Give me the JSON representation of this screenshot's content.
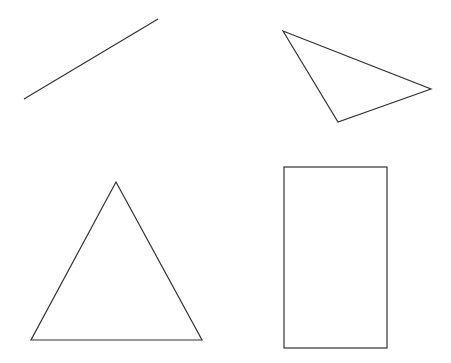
{
  "canvas": {
    "width": 451,
    "height": 363,
    "background": "#ffffff",
    "stroke_color": "#333333"
  },
  "shapes": [
    {
      "kind": "line",
      "name": "line-segment",
      "points": [
        [
          24,
          99
        ],
        [
          158,
          19
        ]
      ]
    },
    {
      "kind": "triangle",
      "name": "scalene-triangle",
      "points": [
        [
          283,
          31
        ],
        [
          431,
          89
        ],
        [
          338,
          122
        ]
      ]
    },
    {
      "kind": "triangle",
      "name": "isosceles-triangle",
      "points": [
        [
          116,
          182
        ],
        [
          31,
          340
        ],
        [
          202,
          340
        ]
      ]
    },
    {
      "kind": "rectangle",
      "name": "rectangle",
      "x": 284,
      "y": 167,
      "width": 103,
      "height": 181
    }
  ]
}
